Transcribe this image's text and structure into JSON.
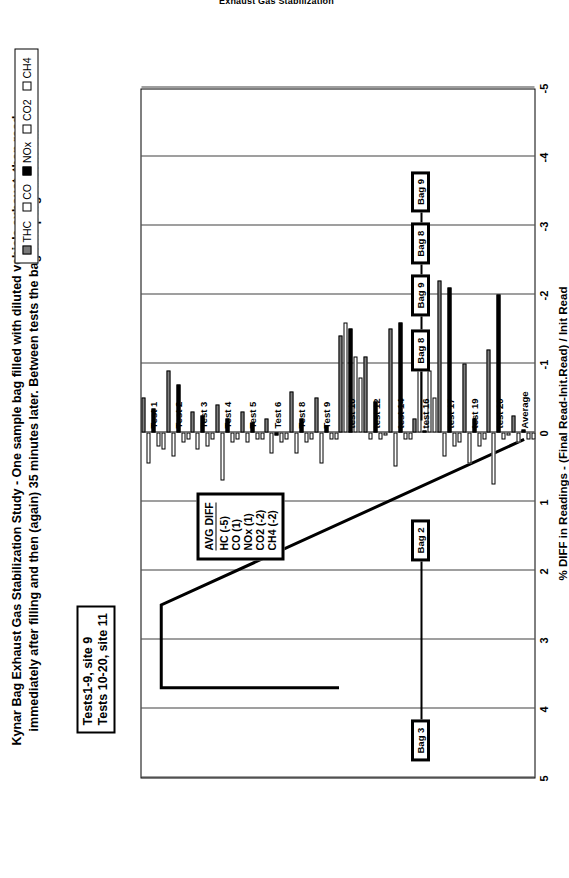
{
  "doc": {
    "title": "Exhaust Gas Stabilization"
  },
  "caption": "Kynar Bag Exhaust Gas Stabilization Study - One sample bag filled with diluted vehicle exhaust, then read immediately after filling and then (again) 35 minutes later.  Between tests the bag was purged/evac'ed.",
  "site_notes": [
    "Tests1-9, site 9",
    "Tests 10-20, site 11"
  ],
  "avg_diff_box": {
    "header": "AVG DIFF",
    "lines": [
      "HC (-5)",
      "CO (1)",
      "NOx (1)",
      "CO2 (-2)",
      "CH4 (-2)"
    ]
  },
  "bag_track": {
    "labels": [
      "Bag 3",
      "Bag 2",
      "Bag 8",
      "Bag 9",
      "Bag 8",
      "Bag 9"
    ]
  },
  "chart_data": {
    "type": "bar",
    "title": "Exhaust Gas Stabilization",
    "xlabel": "",
    "ylabel": "% DIFF in Readings - (Final Read-Init.Read) / Init Read",
    "ylim": [
      -5,
      5
    ],
    "yticks": [
      5,
      4,
      3,
      2,
      1,
      0,
      -1,
      -2,
      -3,
      -4,
      -5
    ],
    "grid": true,
    "legend_position": "top-right",
    "orientation": "horizontal-rotated",
    "categories": [
      "Test 1",
      "Test 2",
      "Test 3",
      "Test 4",
      "Test 5",
      "Test 6",
      "Test 8",
      "Test 9",
      "test 10",
      "test 12",
      "test 14",
      "test 16",
      "test 17",
      "test 19",
      "test 20",
      "Average"
    ],
    "series": [
      {
        "name": "THC",
        "color": "#808080",
        "values": [
          -0.5,
          -0.9,
          -0.3,
          -0.4,
          -0.3,
          -0.2,
          -0.6,
          -0.5,
          -1.4,
          -1.1,
          -1.5,
          -0.2,
          -2.2,
          -1.0,
          -1.2,
          -0.25
        ]
      },
      {
        "name": "CO",
        "color": "#ffffff",
        "values": [
          0.45,
          0.35,
          0.25,
          0.7,
          0.15,
          0.3,
          0.3,
          0.45,
          -1.6,
          0.1,
          0.5,
          -1.3,
          0.35,
          0.45,
          0.75,
          0.15
        ]
      },
      {
        "name": "NOx",
        "color": "#000000",
        "values": [
          -0.35,
          -0.7,
          -0.25,
          -0.2,
          -0.15,
          0.05,
          -0.2,
          -0.1,
          -1.5,
          -0.45,
          -1.6,
          0.0,
          -2.1,
          -0.2,
          -2.0,
          -0.05
        ]
      },
      {
        "name": "CO2",
        "color": "#ffffff",
        "values": [
          0.2,
          0.15,
          0.2,
          0.15,
          0.1,
          0.15,
          0.15,
          0.1,
          -1.1,
          0.1,
          0.1,
          -0.9,
          0.2,
          0.2,
          0.1,
          0.1
        ]
      },
      {
        "name": "CH4",
        "color": "#ffffff",
        "values": [
          0.25,
          0.1,
          0.1,
          0.1,
          0.1,
          0.1,
          0.1,
          0.1,
          -0.8,
          0.05,
          0.1,
          -0.5,
          0.15,
          0.1,
          0.05,
          0.1
        ]
      }
    ]
  },
  "legend": {
    "items": [
      {
        "label": "THC"
      },
      {
        "label": "CO"
      },
      {
        "label": "NOx"
      },
      {
        "label": "CO2"
      },
      {
        "label": "CH4"
      }
    ]
  }
}
